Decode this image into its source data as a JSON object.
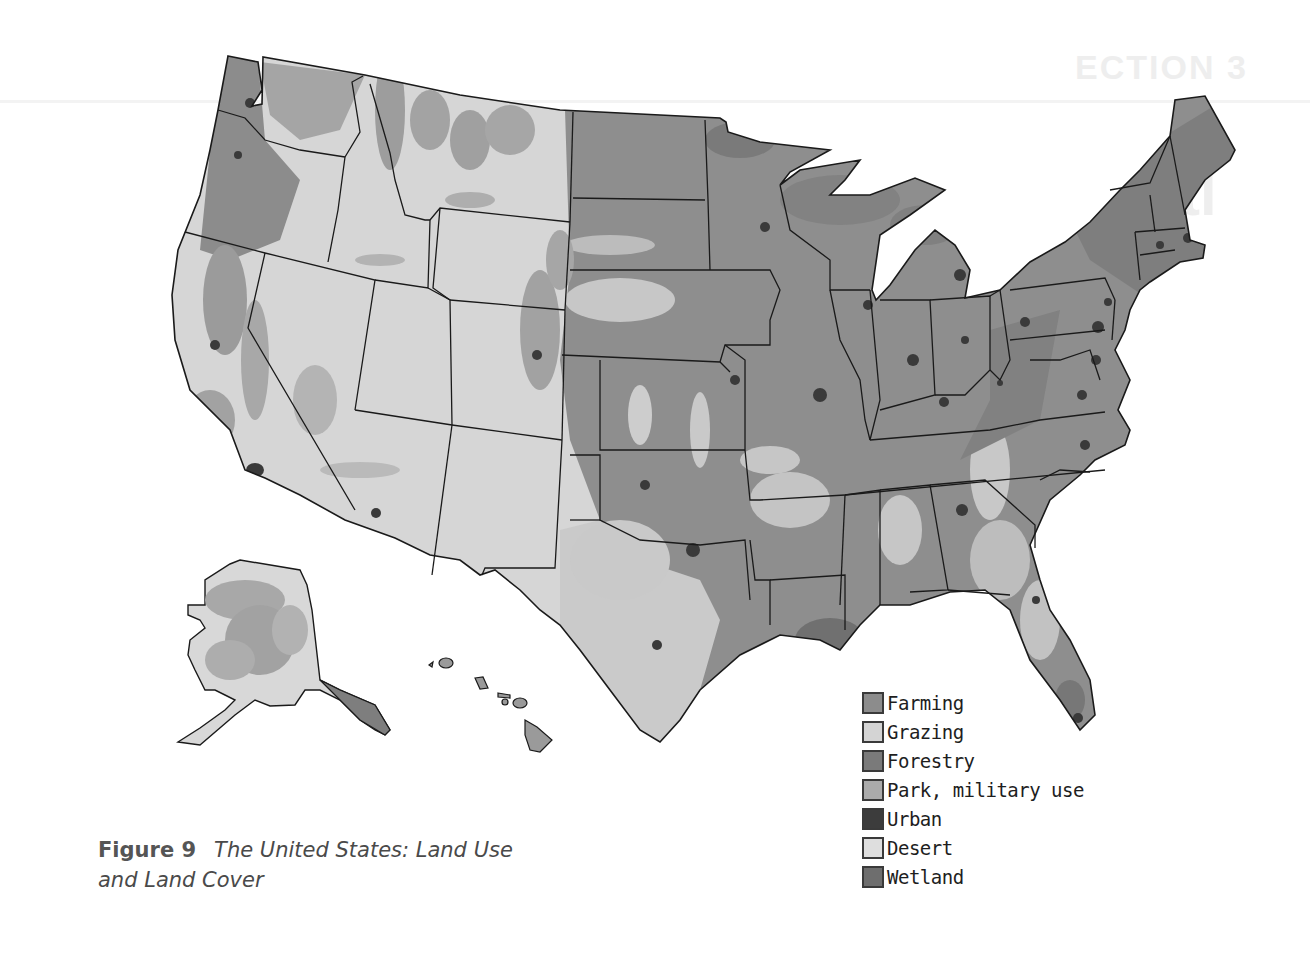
{
  "page": {
    "ghost_section": "ECTION 3",
    "ghost_title": "tl"
  },
  "figure": {
    "number_label": "Figure 9",
    "title_line1": "The United States: Land Use",
    "title_line2": "and Land Cover"
  },
  "legend": {
    "items": [
      {
        "label": "Farming",
        "color": "#8c8c8c",
        "icon": "farming-swatch"
      },
      {
        "label": "Grazing",
        "color": "#d4d4d4",
        "icon": "grazing-swatch"
      },
      {
        "label": "Forestry",
        "color": "#7a7a7a",
        "icon": "forestry-swatch"
      },
      {
        "label": "Park, military use",
        "color": "#ababab",
        "icon": "park-swatch"
      },
      {
        "label": "Urban",
        "color": "#3c3c3c",
        "icon": "urban-swatch"
      },
      {
        "label": "Desert",
        "color": "#dedede",
        "icon": "desert-swatch"
      },
      {
        "label": "Wetland",
        "color": "#6e6e6e",
        "icon": "wetland-swatch"
      }
    ]
  },
  "map": {
    "regions": [
      "Contiguous United States",
      "Alaska",
      "Hawaii"
    ],
    "colors": {
      "background": "#ffffff",
      "border": "#1a1a1a",
      "water": "#ffffff"
    }
  }
}
